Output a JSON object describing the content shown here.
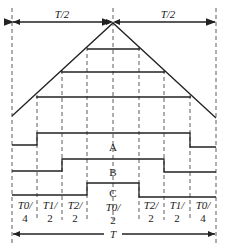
{
  "diagram": {
    "top_labels": {
      "left": "T/2",
      "right": "T/2"
    },
    "waveforms": [
      {
        "name": "A"
      },
      {
        "name": "B"
      },
      {
        "name": "C"
      }
    ],
    "intervals": [
      {
        "num": "T0/",
        "den": "4"
      },
      {
        "num": "T1/",
        "den": "2"
      },
      {
        "num": "T2/",
        "den": "2"
      },
      {
        "num": "T0/",
        "den": "2"
      },
      {
        "num": "T2/",
        "den": "2"
      },
      {
        "num": "T1/",
        "den": "2"
      },
      {
        "num": "T0/",
        "den": "4"
      }
    ],
    "bottom_label": "T"
  }
}
